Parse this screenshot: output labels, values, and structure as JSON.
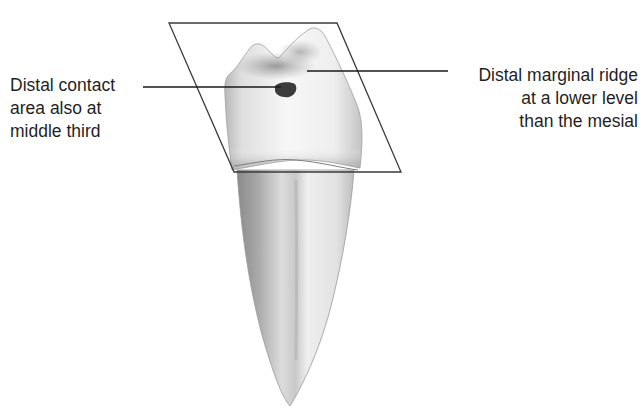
{
  "figure": {
    "colors": {
      "background": "#ffffff",
      "outline": "#3a3a3a",
      "leader_line": "#1a1a1a",
      "contact_area": "#3c3c3c",
      "text": "#1f1f1f"
    },
    "labels": {
      "left": {
        "lines": [
          "Distal contact",
          "area also at",
          "middle third"
        ]
      },
      "right": {
        "lines": [
          "Distal marginal ridge",
          "at a lower level",
          "than the mesial"
        ]
      }
    }
  }
}
